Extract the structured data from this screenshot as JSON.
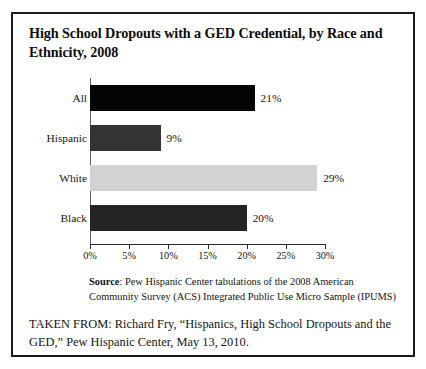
{
  "figure": {
    "title": "High School Dropouts with a GED Credential, by Race and Ethnicity, 2008",
    "source_label": "Source",
    "source_separator": ":",
    "source_text": " Pew Hispanic Center tabulations of the 2008 American Community Survey (ACS) Integrated Public Use Micro Sample (IPUMS)",
    "taken_from": "TAKEN FROM: Richard Fry, “Hispanics, High School Dropouts and the GED,” Pew Hispanic Center, May 13, 2010."
  },
  "chart_data": {
    "type": "bar",
    "orientation": "horizontal",
    "title": "High School Dropouts with a GED Credential, by Race and Ethnicity, 2008",
    "xlabel": "",
    "ylabel": "",
    "categories": [
      "All",
      "Hispanic",
      "White",
      "Black"
    ],
    "values": [
      21,
      9,
      29,
      20
    ],
    "value_labels": [
      "21%",
      "9%",
      "29%",
      "20%"
    ],
    "bar_colors": [
      "#050505",
      "#333333",
      "#d2d2d2",
      "#242424"
    ],
    "xlim": [
      0,
      30
    ],
    "xticks": [
      0,
      5,
      10,
      15,
      20,
      25,
      30
    ],
    "xtick_labels": [
      "0%",
      "5%",
      "10%",
      "15%",
      "20%",
      "25%",
      "30%"
    ],
    "grid": false,
    "legend": "none",
    "units": "percent"
  }
}
